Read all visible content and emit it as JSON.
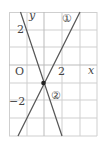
{
  "diagram": {
    "axes": {
      "x_label": "x",
      "y_label": "y",
      "origin_label": "O"
    },
    "ticks": {
      "x_two": "2",
      "y_two": "2",
      "y_neg_two": "−2"
    },
    "lines": [
      {
        "label": "①",
        "equation": "y = 2x − 1"
      },
      {
        "label": "②",
        "equation": "y = −3x − 1"
      }
    ],
    "intersection": {
      "x": 0,
      "y": -1
    },
    "colors": {
      "grid": "#c8c8c8",
      "line": "#555555",
      "text": "#444444"
    }
  }
}
